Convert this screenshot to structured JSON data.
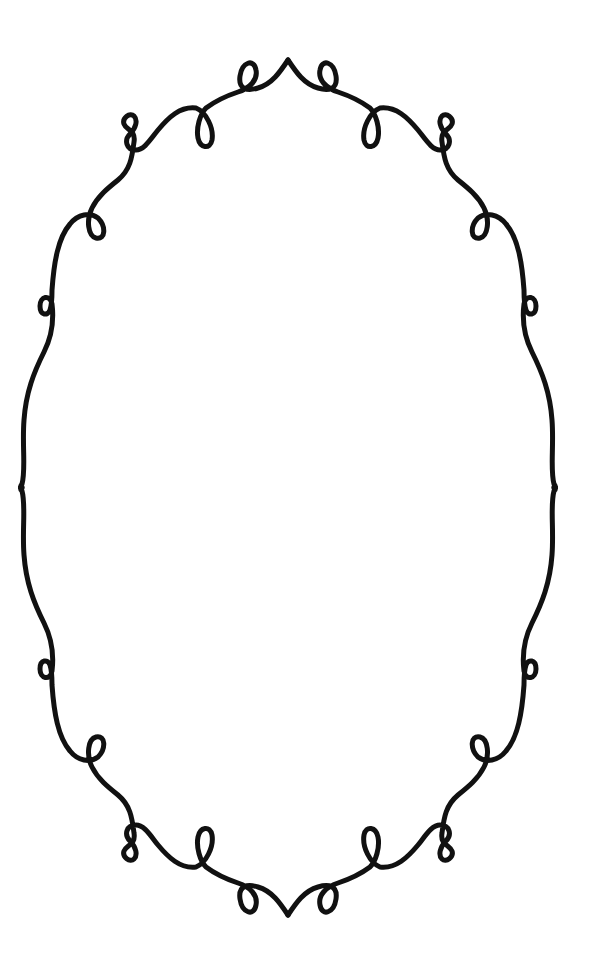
{
  "canvas": {
    "width": 614,
    "height": 963,
    "background": "#ffffff"
  },
  "frame": {
    "description": "Decorative oval flourish frame with loops and curls",
    "stroke_color": "#111111",
    "stroke_width": 5,
    "center": [
      307,
      487
    ]
  }
}
